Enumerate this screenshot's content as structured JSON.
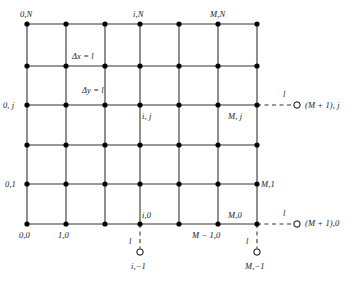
{
  "figure": {
    "kind": "finite-difference-grid",
    "colors": {
      "line": "#333333",
      "node": "#000000",
      "ghost_stroke": "#000000",
      "ghost_fill": "#ffffff",
      "text": "#1a1a1a",
      "background": "#ffffff"
    }
  },
  "grid": {
    "columns": 7,
    "rows": 6,
    "x_positions": [
      27,
      66,
      105,
      140,
      179,
      218,
      257
    ],
    "y_positions": [
      24,
      66,
      105,
      145,
      184,
      224
    ],
    "node_radius": 2.6,
    "line_width": 1.1
  },
  "spacing_labels": [
    {
      "id": "dx",
      "text": "Δx = l",
      "x": 72,
      "y": 52
    },
    {
      "id": "dy",
      "text": "Δy = l",
      "x": 82,
      "y": 86
    }
  ],
  "node_labels": [
    {
      "id": "origin-top-left",
      "text": "0,N",
      "x": 20,
      "y": 10
    },
    {
      "id": "top-i",
      "text": "i,N",
      "x": 133,
      "y": 10
    },
    {
      "id": "top-right",
      "text": "M,N",
      "x": 210,
      "y": 10
    },
    {
      "id": "left-j",
      "text": "0, j",
      "x": 3,
      "y": 101
    },
    {
      "id": "interior-ij",
      "text": "i, j",
      "x": 142,
      "y": 112
    },
    {
      "id": "right-mj",
      "text": "M, j",
      "x": 228,
      "y": 112
    },
    {
      "id": "left-01",
      "text": "0,1",
      "x": 5,
      "y": 180
    },
    {
      "id": "right-m1",
      "text": "M,1",
      "x": 261,
      "y": 180
    },
    {
      "id": "bottom-i0",
      "text": "i,0",
      "x": 142,
      "y": 211
    },
    {
      "id": "bottom-m0",
      "text": "M,0",
      "x": 228,
      "y": 211
    },
    {
      "id": "bottom-00",
      "text": "0,0",
      "x": 19,
      "y": 231
    },
    {
      "id": "bottom-10",
      "text": "1,0",
      "x": 58,
      "y": 231
    },
    {
      "id": "bottom-m-1-0",
      "text": "M − 1,0",
      "x": 192,
      "y": 231
    }
  ],
  "ghost_nodes": [
    {
      "id": "ghost-right-j",
      "label": "(M + 1), j",
      "label_x": 305,
      "label_y": 101,
      "circle_x": 297,
      "circle_y": 105,
      "circle_r": 3.2,
      "dash_from_x": 257,
      "dash_from_y": 105,
      "dash_to_x": 293,
      "dash_to_y": 105,
      "length_label": "l",
      "length_label_x": 283,
      "length_label_y": 90
    },
    {
      "id": "ghost-right-0",
      "label": "(M + 1),0",
      "label_x": 305,
      "label_y": 219,
      "circle_x": 297,
      "circle_y": 224,
      "circle_r": 3.2,
      "dash_from_x": 257,
      "dash_from_y": 224,
      "dash_to_x": 293,
      "dash_to_y": 224,
      "length_label": "l",
      "length_label_x": 283,
      "length_label_y": 209
    },
    {
      "id": "ghost-bottom-i",
      "label": "i,−1",
      "label_x": 131,
      "label_y": 262,
      "circle_x": 140,
      "circle_y": 252,
      "circle_r": 3.2,
      "dash_from_x": 140,
      "dash_from_y": 224,
      "dash_to_x": 140,
      "dash_to_y": 248,
      "length_label": "l",
      "length_label_x": 129,
      "length_label_y": 237
    },
    {
      "id": "ghost-bottom-m",
      "label": "M,−1",
      "label_x": 245,
      "label_y": 262,
      "circle_x": 257,
      "circle_y": 252,
      "circle_r": 3.2,
      "dash_from_x": 257,
      "dash_from_y": 224,
      "dash_to_x": 257,
      "dash_to_y": 248,
      "length_label": "l",
      "length_label_x": 246,
      "length_label_y": 237
    }
  ]
}
